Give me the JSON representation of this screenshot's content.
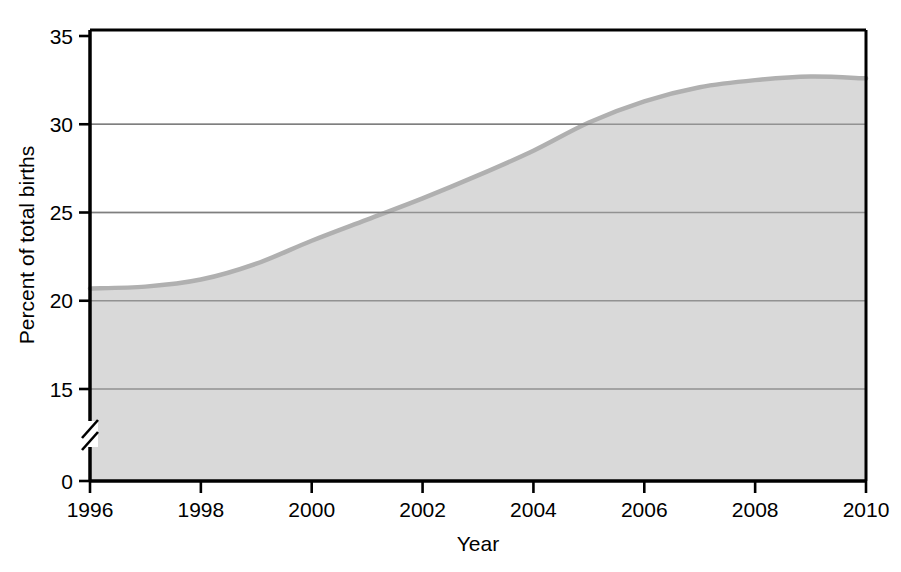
{
  "chart_data": {
    "type": "area",
    "title": "",
    "subtitle": "",
    "xlabel": "Year",
    "ylabel": "Percent of total births",
    "xlim": [
      1996,
      2010
    ],
    "ylim": [
      0,
      35
    ],
    "y_axis_break": true,
    "y_break_between": [
      0,
      15
    ],
    "grid": "horizontal",
    "legend": "none",
    "xticks": [
      1996,
      1998,
      2000,
      2002,
      2004,
      2006,
      2008,
      2010
    ],
    "xtick_labels": [
      "1996",
      "1998",
      "2000",
      "2002",
      "2004",
      "2006",
      "2008",
      "2010"
    ],
    "yticks": [
      0,
      15,
      20,
      25,
      30,
      35
    ],
    "ytick_labels": [
      "0",
      "15",
      "20",
      "25",
      "30",
      "35"
    ],
    "gridline_values": [
      15,
      20,
      25,
      30
    ],
    "series": [
      {
        "name": "Percent of total births",
        "x": [
          1996,
          1997,
          1998,
          1999,
          2000,
          2001,
          2002,
          2003,
          2004,
          2005,
          2006,
          2007,
          2008,
          2009,
          2010
        ],
        "values": [
          20.7,
          20.8,
          21.2,
          22.1,
          23.4,
          24.6,
          25.8,
          27.1,
          28.5,
          30.1,
          31.3,
          32.1,
          32.5,
          32.7,
          32.6
        ]
      }
    ],
    "colors": {
      "fill": "#d9d9d9",
      "line": "#b0b0b0",
      "axis": "#000000",
      "gridline": "#7a7a7a",
      "background": "#ffffff"
    }
  }
}
